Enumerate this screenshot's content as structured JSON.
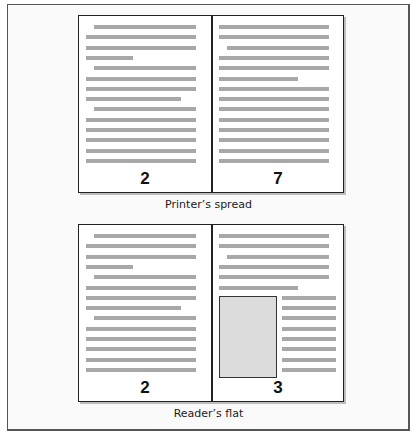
{
  "diagram": {
    "spreads": [
      {
        "id": "printers-spread",
        "caption": "Printer’s spread",
        "left_page": {
          "number": "2",
          "lines": [
            {
              "indent": true,
              "end": "full"
            },
            {
              "indent": false,
              "end": "full"
            },
            {
              "indent": false,
              "end": "full"
            },
            {
              "indent": false,
              "end": "short"
            },
            {
              "indent": true,
              "end": "full"
            },
            {
              "indent": false,
              "end": "full"
            },
            {
              "indent": false,
              "end": "full"
            },
            {
              "indent": false,
              "end": "medium"
            },
            {
              "indent": true,
              "end": "full"
            },
            {
              "indent": false,
              "end": "full"
            },
            {
              "indent": false,
              "end": "full"
            },
            {
              "indent": false,
              "end": "full"
            },
            {
              "indent": false,
              "end": "full"
            },
            {
              "indent": false,
              "end": "full"
            }
          ]
        },
        "right_page": {
          "number": "7",
          "lines": [
            {
              "indent": false,
              "end": "full"
            },
            {
              "indent": false,
              "end": "full"
            },
            {
              "indent": true,
              "end": "full"
            },
            {
              "indent": false,
              "end": "full"
            },
            {
              "indent": false,
              "end": "full"
            },
            {
              "indent": false,
              "end": "medium-short"
            },
            {
              "indent": false,
              "end": "full"
            },
            {
              "indent": false,
              "end": "full"
            },
            {
              "indent": false,
              "end": "full"
            },
            {
              "indent": false,
              "end": "full"
            },
            {
              "indent": false,
              "end": "full"
            },
            {
              "indent": false,
              "end": "full"
            },
            {
              "indent": false,
              "end": "full"
            },
            {
              "indent": false,
              "end": "full"
            }
          ]
        }
      },
      {
        "id": "readers-flat",
        "caption": "Reader’s flat",
        "left_page": {
          "number": "2",
          "lines": [
            {
              "indent": true,
              "end": "full"
            },
            {
              "indent": false,
              "end": "full"
            },
            {
              "indent": false,
              "end": "full"
            },
            {
              "indent": false,
              "end": "short"
            },
            {
              "indent": true,
              "end": "full"
            },
            {
              "indent": false,
              "end": "full"
            },
            {
              "indent": false,
              "end": "full"
            },
            {
              "indent": false,
              "end": "medium"
            },
            {
              "indent": true,
              "end": "full"
            },
            {
              "indent": false,
              "end": "full"
            },
            {
              "indent": false,
              "end": "full"
            },
            {
              "indent": false,
              "end": "full"
            },
            {
              "indent": false,
              "end": "full"
            },
            {
              "indent": false,
              "end": "full"
            }
          ]
        },
        "right_page": {
          "number": "3",
          "lines": [
            {
              "indent": false,
              "end": "full"
            },
            {
              "indent": false,
              "end": "full"
            },
            {
              "indent": true,
              "end": "full"
            },
            {
              "indent": false,
              "end": "full"
            },
            {
              "indent": false,
              "end": "full"
            },
            {
              "indent": false,
              "end": "medium-short"
            }
          ],
          "figure": {
            "label": "image-placeholder",
            "fill": "#dcdcdc"
          },
          "side_column_lines": 8
        }
      }
    ],
    "colors": {
      "text_line": "#a8a8a8",
      "page_border": "#222222",
      "background": "#fafafa",
      "figure_fill": "#dcdcdc"
    }
  }
}
